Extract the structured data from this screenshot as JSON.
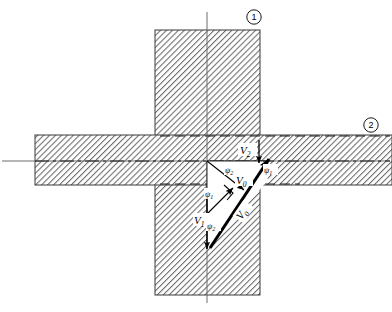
{
  "figure": {
    "background": "#ffffff",
    "hatch_color": "#6e6e6e",
    "outline_color": "#2b2b2b",
    "vector_color": "#000000"
  },
  "callouts": [
    {
      "id": "callout-1",
      "label": "1",
      "x": 254,
      "y": 17
    },
    {
      "id": "callout-2",
      "label": "2",
      "x": 371,
      "y": 125
    }
  ],
  "vectors": [
    {
      "name": "V0-center",
      "label": "V",
      "sub": "0",
      "x": 239,
      "y": 184
    },
    {
      "name": "V0-diagonal",
      "label": "V",
      "sub": "0",
      "x": 246,
      "y": 214,
      "rotate": -55
    },
    {
      "name": "V1",
      "label": "V",
      "sub": "1",
      "x": 200,
      "y": 223
    },
    {
      "name": "V2",
      "label": "V",
      "sub": "2",
      "x": 245,
      "y": 152
    }
  ],
  "angles": [
    {
      "name": "psi-1-right",
      "label": "ψ",
      "sub": "1",
      "x": 268,
      "y": 172
    },
    {
      "name": "psi-1-left",
      "label": "ψ",
      "sub": "1",
      "x": 209,
      "y": 196
    },
    {
      "name": "psi-2-top",
      "label": "ψ",
      "sub": "2",
      "x": 229,
      "y": 172
    },
    {
      "name": "psi-2-bottom",
      "label": "ψ",
      "sub": "2",
      "x": 211,
      "y": 228
    }
  ],
  "geometry": {
    "vertical_bar": {
      "x": 155,
      "y": 30,
      "w": 105,
      "h": 265
    },
    "horizontal_bar": {
      "x": 35,
      "y": 135,
      "w": 357,
      "h": 50
    },
    "vertical_axis": {
      "x": 207,
      "y1": 12,
      "y2": 303
    },
    "horizontal_axis": {
      "y": 161,
      "x1": 2,
      "x2": 390
    },
    "triangle": [
      [
        207,
        161
      ],
      [
        263,
        161
      ],
      [
        207,
        248
      ]
    ],
    "origin": {
      "x": 207,
      "y": 161
    }
  }
}
